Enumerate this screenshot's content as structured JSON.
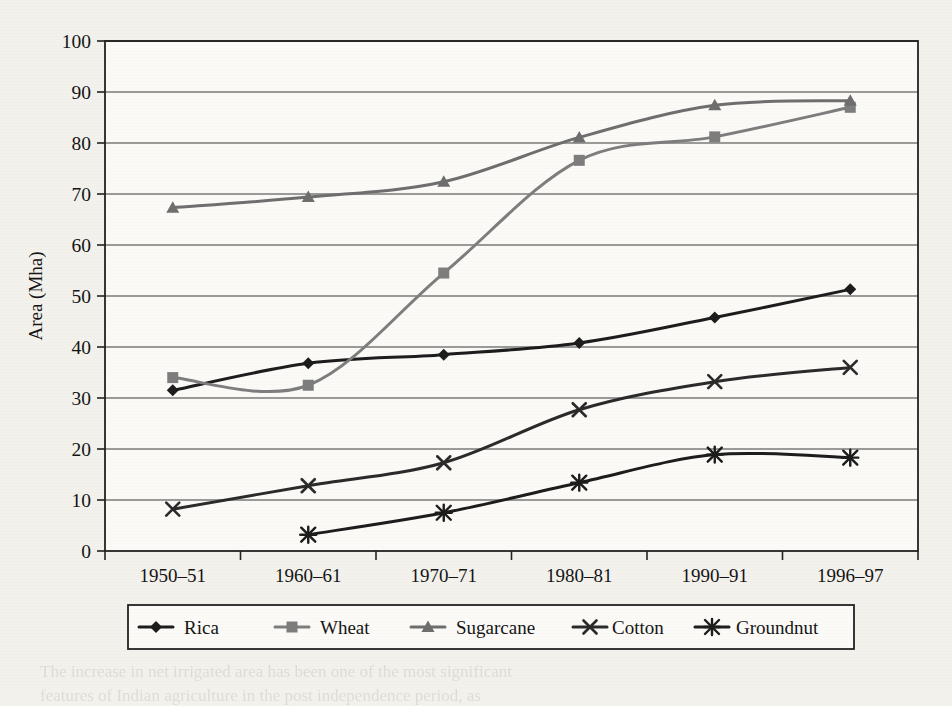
{
  "page": {
    "background_color": "#f3f1ec",
    "bleed_text": [
      {
        "text": "regions and crops, the aggregate trends reveal the broad",
        "x": 470,
        "y": 72,
        "size": 17
      },
      {
        "text": "pattern of land use. Since cropping intensity in",
        "x": 470,
        "y": 100,
        "size": 17
      },
      {
        "text": "increased, the net sown area and the gross",
        "x": 470,
        "y": 128,
        "size": 17
      },
      {
        "text": "cropped area have grown apart",
        "x": 470,
        "y": 156,
        "size": 17
      },
      {
        "text": "under major crops is given in",
        "x": 470,
        "y": 262,
        "size": 17
      },
      {
        "text": "cereals and other crops, and as a result of this there were",
        "x": 250,
        "y": 440,
        "size": 17
      },
      {
        "text": "changes in the cropping pattern in the period.",
        "x": 250,
        "y": 468,
        "size": 17
      },
      {
        "text": "5.4.1   Growth in Irrigation Potential Created and Utilized",
        "x": 210,
        "y": 524,
        "size": 20
      },
      {
        "text": "13.7",
        "x": 742,
        "y": 524,
        "size": 20
      },
      {
        "text": "The increase in net irrigated area has been one of the most significant",
        "x": 40,
        "y": 662,
        "size": 17
      },
      {
        "text": "features of Indian agriculture in the post independence period, as",
        "x": 40,
        "y": 686,
        "size": 17
      }
    ]
  },
  "chart_data": {
    "type": "line",
    "title": "",
    "subtitle": "",
    "xlabel": "",
    "ylabel": "Area (Mha)",
    "categories": [
      "1950–51",
      "1960–61",
      "1970–71",
      "1980–81",
      "1990–91",
      "1996–97"
    ],
    "ylim": [
      0,
      100
    ],
    "ytick_step": 10,
    "yticks": [
      "0",
      "10",
      "20",
      "30",
      "40",
      "50",
      "60",
      "70",
      "80",
      "90",
      "100"
    ],
    "grid": "horizontal",
    "legend_position": "bottom",
    "series": [
      {
        "name": "Rica",
        "marker": "diamond",
        "color": "#1c1c1c",
        "values": [
          31.5,
          36.8,
          38.5,
          40.8,
          45.8,
          51.3
        ]
      },
      {
        "name": "Wheat",
        "marker": "square",
        "color": "#7d7d7d",
        "values": [
          34.0,
          32.5,
          54.5,
          76.6,
          81.2,
          87.0
        ]
      },
      {
        "name": "Sugarcane",
        "marker": "triangle",
        "color": "#6e6e6e",
        "values": [
          67.3,
          69.4,
          72.4,
          81.1,
          87.4,
          88.3
        ]
      },
      {
        "name": "Cotton",
        "marker": "cross",
        "color": "#2a2a2a",
        "values": [
          8.2,
          12.8,
          17.3,
          27.7,
          33.2,
          36.0
        ]
      },
      {
        "name": "Groundnut",
        "marker": "asterisk",
        "color": "#1c1c1c",
        "values": [
          null,
          3.2,
          7.5,
          13.4,
          18.9,
          18.3
        ]
      }
    ]
  }
}
